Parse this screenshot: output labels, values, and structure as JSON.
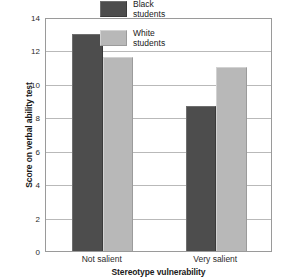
{
  "chart_data": {
    "type": "bar",
    "title": "",
    "subtitle": "",
    "xlabel": "Stereotype vulnerability",
    "ylabel": "Score on verbal ability test",
    "categories": [
      "Not salient",
      "Very salient"
    ],
    "series": [
      {
        "name": "Black students",
        "name_line1": "Black",
        "name_line2": "students",
        "color": "#4d4d4d",
        "values": [
          13.0,
          8.7
        ]
      },
      {
        "name": "White students",
        "name_line1": "White",
        "name_line2": "students",
        "color": "#b8b8b8",
        "values": [
          11.6,
          11.0
        ]
      }
    ],
    "ylim": [
      0,
      14
    ],
    "ytick_labels": [
      "0",
      "2",
      "4",
      "6",
      "8",
      "10",
      "12",
      "14"
    ],
    "ytick_values": [
      0,
      2,
      4,
      6,
      8,
      10,
      12,
      14
    ],
    "grid": "horizontal",
    "legend_position": "top-center",
    "axis_color": "#9a9a9a",
    "grid_color": "#b9b9b9"
  }
}
